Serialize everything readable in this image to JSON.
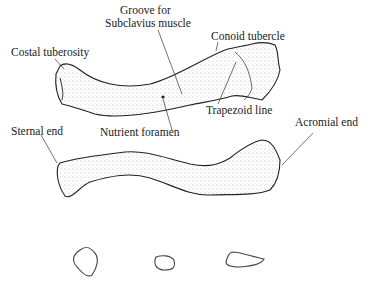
{
  "figure": {
    "views": [
      "superior view",
      "inferior/anterior view",
      "cross sections"
    ],
    "labels": {
      "groove_line1": "Groove for",
      "groove_line2": "Subclavius muscle",
      "conoid": "Conoid tubercle",
      "costal": "Costal tuberosity",
      "trapezoid": "Trapezoid line",
      "sternal": "Sternal end",
      "nutrient": "Nutrient foramen",
      "acromial": "Acromial end"
    },
    "cross_sections": [
      "medial section",
      "middle section",
      "lateral section"
    ]
  }
}
